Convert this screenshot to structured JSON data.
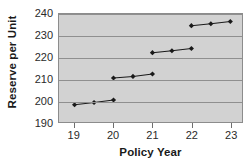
{
  "chart_data": {
    "type": "line",
    "title": "",
    "xlabel": "Policy Year",
    "ylabel": "Reserve per Unit",
    "xlim": [
      18.6,
      23.3
    ],
    "ylim": [
      190,
      240
    ],
    "xticks": [
      19,
      20,
      21,
      22,
      23
    ],
    "xtick_labels": [
      "19",
      "20",
      "21",
      "22",
      "23"
    ],
    "yticks": [
      190,
      200,
      210,
      220,
      230,
      240
    ],
    "ytick_labels": [
      "190",
      "200",
      "210",
      "220",
      "230",
      "240"
    ],
    "grid": true,
    "grid_axis": "y",
    "legend": false,
    "plot_background": "#d2d2d2",
    "marker_color": "#1a1a1a",
    "line_color": "#1a1a1a",
    "marker": "diamond",
    "series": [
      {
        "name": "segment-1",
        "x": [
          19.0,
          19.5,
          20.0
        ],
        "values": [
          198.0,
          199.0,
          200.2
        ]
      },
      {
        "name": "segment-2",
        "x": [
          20.0,
          20.5,
          21.0
        ],
        "values": [
          210.4,
          211.1,
          212.2
        ]
      },
      {
        "name": "segment-3",
        "x": [
          21.0,
          21.5,
          22.0
        ],
        "values": [
          222.1,
          223.0,
          224.0
        ]
      },
      {
        "name": "segment-4",
        "x": [
          22.0,
          22.5,
          23.0
        ],
        "values": [
          234.6,
          235.5,
          236.5
        ]
      }
    ]
  }
}
